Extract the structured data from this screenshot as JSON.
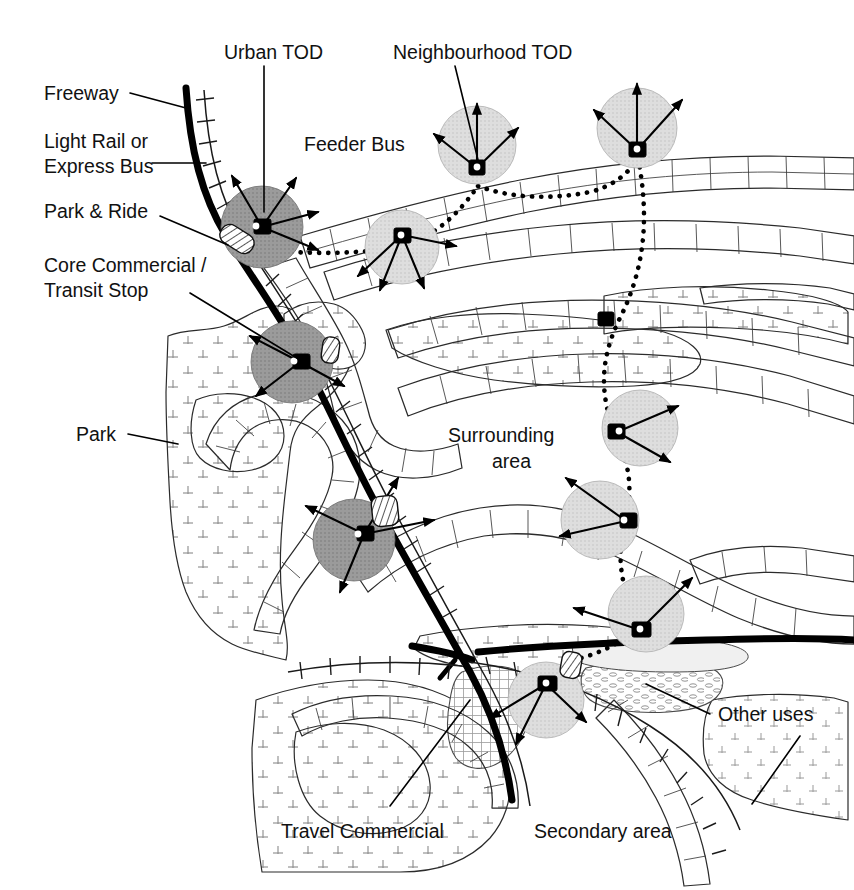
{
  "figure": {
    "type": "annotated-map-diagram"
  },
  "colors": {
    "urban_tod_fill": "#9b9b9b",
    "neighbourhood_tod_fill": "#dcdcdc",
    "freeway_stroke": "#000000",
    "text": "#111111",
    "background": "#ffffff",
    "park_fill": "#ffffff",
    "other_uses_fill": "#f4f4f4"
  },
  "labels": {
    "freeway": "Freeway",
    "light_rail": "Light Rail or",
    "light_rail_2": "Express Bus",
    "park_and_ride": "Park & Ride",
    "core_commercial": "Core Commercial /",
    "core_commercial_2": "Transit Stop",
    "park": "Park",
    "urban_tod": "Urban TOD",
    "neighbourhood_tod": "Neighbourhood TOD",
    "feeder_bus": "Feeder Bus",
    "surrounding_area": "Surrounding",
    "surrounding_area_2": "area",
    "travel_commercial": "Travel Commercial",
    "secondary_area": "Secondary area",
    "other_uses": "Other uses"
  },
  "legend_entries": [
    {
      "key": "freeway",
      "label": "Freeway",
      "symbol": "thick-black-line"
    },
    {
      "key": "light_rail",
      "label": "Light Rail or Express Bus",
      "symbol": "ticked-rail-line"
    },
    {
      "key": "park_and_ride",
      "label": "Park & Ride",
      "symbol": "hatched-rounded-rect"
    },
    {
      "key": "core_commercial",
      "label": "Core Commercial / Transit Stop",
      "symbol": "dark-gray-circle"
    },
    {
      "key": "park",
      "label": "Park",
      "symbol": "tree-stipple-area"
    },
    {
      "key": "urban_tod",
      "label": "Urban TOD",
      "symbol": "dark-gray-circle"
    },
    {
      "key": "neighbourhood_tod",
      "label": "Neighbourhood TOD",
      "symbol": "light-gray-circle"
    },
    {
      "key": "feeder_bus",
      "label": "Feeder Bus",
      "symbol": "dotted-route-line"
    },
    {
      "key": "surrounding_area",
      "label": "Surrounding area",
      "symbol": "white-area"
    },
    {
      "key": "travel_commercial",
      "label": "Travel Commercial",
      "symbol": "cross-hatch-area"
    },
    {
      "key": "secondary_area",
      "label": "Secondary area",
      "symbol": "light-stipple-area"
    },
    {
      "key": "other_uses",
      "label": "Other uses",
      "symbol": "oval-dot-pattern-area"
    }
  ],
  "tod_nodes": [
    {
      "id": "urban-tod-north",
      "type": "urban",
      "cx": 262,
      "cy": 227,
      "r": 40,
      "radials": 4
    },
    {
      "id": "urban-tod-core",
      "type": "urban",
      "cx": 300,
      "cy": 363,
      "r": 40,
      "radials": 3
    },
    {
      "id": "urban-tod-south",
      "type": "urban",
      "cx": 363,
      "cy": 538,
      "r": 40,
      "radials": 4
    },
    {
      "id": "neighbourhood-tod-1",
      "type": "neighbourhood",
      "cx": 477,
      "cy": 168,
      "r": 38,
      "radials": 4
    },
    {
      "id": "neighbourhood-tod-2",
      "type": "neighbourhood",
      "cx": 402,
      "cy": 235,
      "r": 36,
      "radials": 4
    },
    {
      "id": "neighbourhood-tod-3",
      "type": "neighbourhood",
      "cx": 637,
      "cy": 150,
      "r": 40,
      "radials": 4
    },
    {
      "id": "neighbourhood-tod-4",
      "type": "neighbourhood",
      "cx": 617,
      "cy": 432,
      "r": 38,
      "radials": 3
    },
    {
      "id": "neighbourhood-tod-5",
      "type": "neighbourhood",
      "cx": 625,
      "cy": 521,
      "r": 38,
      "radials": 3
    },
    {
      "id": "neighbourhood-tod-6",
      "type": "neighbourhood",
      "cx": 637,
      "cy": 620,
      "r": 38,
      "radials": 3
    },
    {
      "id": "neighbourhood-tod-7",
      "type": "neighbourhood",
      "cx": 546,
      "cy": 687,
      "r": 38,
      "radials": 4
    }
  ],
  "park_and_ride_markers": [
    {
      "id": "park-and-ride-north",
      "x": 226,
      "y": 243
    },
    {
      "id": "park-and-ride-mid",
      "x": 331,
      "y": 349
    },
    {
      "id": "park-and-ride-south",
      "x": 386,
      "y": 510
    },
    {
      "id": "park-and-ride-bottom",
      "x": 570,
      "y": 663
    }
  ]
}
